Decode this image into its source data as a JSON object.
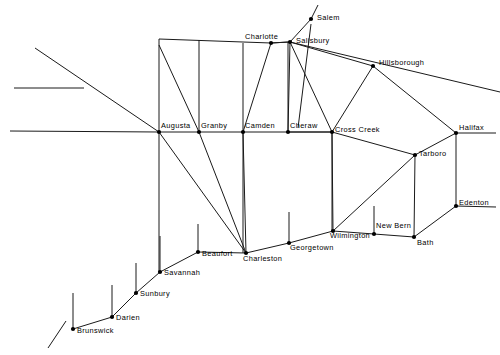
{
  "map": {
    "title": "Colonial Road Network Map",
    "background_color": "#ffffff",
    "line_color": "#1a1a1a",
    "node_color": "#000000",
    "width": 500,
    "height": 355,
    "cities": [
      {
        "name": "Salem",
        "x": 311,
        "y": 19,
        "label_x": 317,
        "label_y": 14,
        "dot": true
      },
      {
        "name": "Salisbury",
        "x": 290,
        "y": 42,
        "label_x": 296,
        "label_y": 37,
        "dot": true
      },
      {
        "name": "Charlotte",
        "x": 271,
        "y": 43,
        "label_x": 245,
        "label_y": 33,
        "dot": true
      },
      {
        "name": "Hillsborough",
        "x": 373,
        "y": 66,
        "label_x": 379,
        "label_y": 59,
        "dot": true
      },
      {
        "name": "Augusta",
        "x": 159,
        "y": 132,
        "label_x": 161,
        "label_y": 122,
        "dot": true
      },
      {
        "name": "Granby",
        "x": 199,
        "y": 132,
        "label_x": 201,
        "label_y": 122,
        "dot": true
      },
      {
        "name": "Camden",
        "x": 243,
        "y": 132,
        "label_x": 245,
        "label_y": 122,
        "dot": true
      },
      {
        "name": "Cheraw",
        "x": 288,
        "y": 132,
        "label_x": 290,
        "label_y": 122,
        "dot": true
      },
      {
        "name": "Cross Creek",
        "x": 332,
        "y": 132,
        "label_x": 335,
        "label_y": 126,
        "dot": true
      },
      {
        "name": "Halifax",
        "x": 456,
        "y": 133,
        "label_x": 459,
        "label_y": 124,
        "dot": true
      },
      {
        "name": "Tarboro",
        "x": 415,
        "y": 155,
        "label_x": 419,
        "label_y": 150,
        "dot": true
      },
      {
        "name": "Edenton",
        "x": 456,
        "y": 206,
        "label_x": 459,
        "label_y": 199,
        "dot": true
      },
      {
        "name": "Wilmington",
        "x": 333,
        "y": 231,
        "label_x": 330,
        "label_y": 232,
        "dot": true
      },
      {
        "name": "New Bern",
        "x": 374,
        "y": 234,
        "label_x": 376,
        "label_y": 222,
        "dot": true
      },
      {
        "name": "Bath",
        "x": 414,
        "y": 237,
        "label_x": 417,
        "label_y": 239,
        "dot": true
      },
      {
        "name": "Georgetown",
        "x": 289,
        "y": 243,
        "label_x": 290,
        "label_y": 244,
        "dot": true
      },
      {
        "name": "Charleston",
        "x": 246,
        "y": 253,
        "label_x": 243,
        "label_y": 255,
        "dot": true
      },
      {
        "name": "Beaufort",
        "x": 198,
        "y": 252,
        "label_x": 202,
        "label_y": 250,
        "dot": true
      },
      {
        "name": "Savannah",
        "x": 160,
        "y": 272,
        "label_x": 164,
        "label_y": 269,
        "dot": true
      },
      {
        "name": "Sunbury",
        "x": 136,
        "y": 293,
        "label_x": 140,
        "label_y": 290,
        "dot": true
      },
      {
        "name": "Darien",
        "x": 112,
        "y": 317,
        "label_x": 116,
        "label_y": 314,
        "dot": true
      },
      {
        "name": "Brunswick",
        "x": 73,
        "y": 329,
        "label_x": 77,
        "label_y": 327,
        "dot": true
      }
    ],
    "edges": [
      {
        "from": "Augusta",
        "to": "Granby"
      },
      {
        "from": "Granby",
        "to": "Camden"
      },
      {
        "from": "Camden",
        "to": "Cheraw"
      },
      {
        "from": "Cheraw",
        "to": "Cross Creek"
      },
      {
        "from": "Cross Creek",
        "to": "Tarboro"
      },
      {
        "from": "Tarboro",
        "to": "Halifax"
      },
      {
        "from": "Halifax",
        "to": "Edenton"
      },
      {
        "from": "Edenton",
        "to": "Bath"
      },
      {
        "from": "Tarboro",
        "to": "Bath"
      },
      {
        "from": "Bath",
        "to": "New Bern"
      },
      {
        "from": "New Bern",
        "to": "Wilmington"
      },
      {
        "from": "Wilmington",
        "to": "Tarboro"
      },
      {
        "from": "Wilmington",
        "to": "Cross Creek"
      },
      {
        "from": "Wilmington",
        "to": "Georgetown"
      },
      {
        "from": "Georgetown",
        "to": "Charleston"
      },
      {
        "from": "Charleston",
        "to": "Beaufort"
      },
      {
        "from": "Beaufort",
        "to": "Savannah"
      },
      {
        "from": "Savannah",
        "to": "Sunbury"
      },
      {
        "from": "Sunbury",
        "to": "Darien"
      },
      {
        "from": "Darien",
        "to": "Brunswick"
      },
      {
        "from": "Charleston",
        "to": "Camden"
      },
      {
        "from": "Charleston",
        "to": "Granby"
      },
      {
        "from": "Charleston",
        "to": "Augusta"
      },
      {
        "from": "Charlotte",
        "to": "Camden"
      },
      {
        "from": "Charlotte",
        "to": "Salisbury"
      },
      {
        "from": "Salisbury",
        "to": "Salem"
      },
      {
        "from": "Salisbury",
        "to": "Cheraw"
      },
      {
        "from": "Salisbury",
        "to": "Cross Creek"
      },
      {
        "from": "Salisbury",
        "to": "Hillsborough"
      },
      {
        "from": "Hillsborough",
        "to": "Cross Creek"
      },
      {
        "from": "Hillsborough",
        "to": "Halifax"
      },
      {
        "from": "Cross Creek",
        "to": "Cheraw"
      }
    ],
    "extra_segments": [
      {
        "name": "augusta-vertical",
        "x1": 159,
        "y1": 132,
        "x2": 159,
        "y2": 39
      },
      {
        "name": "augusta-to-charlotte",
        "x1": 159,
        "y1": 39,
        "x2": 271,
        "y2": 43
      },
      {
        "name": "augusta-diag-granby",
        "x1": 159,
        "y1": 45,
        "x2": 199,
        "y2": 132
      },
      {
        "name": "granby-vertical",
        "x1": 199,
        "y1": 132,
        "x2": 199,
        "y2": 40
      },
      {
        "name": "camden-vertical-up",
        "x1": 243,
        "y1": 132,
        "x2": 243,
        "y2": 43
      },
      {
        "name": "cheraw-vertical-up",
        "x1": 288,
        "y1": 132,
        "x2": 288,
        "y2": 42
      },
      {
        "name": "cheraw-charlotte-top",
        "x1": 271,
        "y1": 43,
        "x2": 288,
        "y2": 42
      },
      {
        "name": "crosscreek-vert-down",
        "x1": 332,
        "y1": 132,
        "x2": 332,
        "y2": 231
      },
      {
        "name": "camden-vert-down",
        "x1": 243,
        "y1": 132,
        "x2": 243,
        "y2": 253
      },
      {
        "name": "augusta-vert-down",
        "x1": 159,
        "y1": 132,
        "x2": 159,
        "y2": 272
      },
      {
        "name": "salisbury-longline-l",
        "x1": 290,
        "y1": 42,
        "x2": 500,
        "y2": 92
      },
      {
        "name": "left-diagonal-long",
        "x1": 35,
        "y1": 48,
        "x2": 159,
        "y2": 132
      },
      {
        "name": "left-horiz-upper",
        "x1": 14,
        "y1": 88,
        "x2": 84,
        "y2": 88
      },
      {
        "name": "left-horiz-main",
        "x1": 10,
        "y1": 131,
        "x2": 159,
        "y2": 132
      },
      {
        "name": "halifax-right-stub",
        "x1": 456,
        "y1": 133,
        "x2": 496,
        "y2": 133
      },
      {
        "name": "edenton-right-stub",
        "x1": 456,
        "y1": 206,
        "x2": 496,
        "y2": 207
      },
      {
        "name": "brunswick-downleft",
        "x1": 66,
        "y1": 321,
        "x2": 48,
        "y2": 348
      },
      {
        "name": "tick-beaufort",
        "x1": 198,
        "y1": 252,
        "x2": 198,
        "y2": 224
      },
      {
        "name": "tick-georgetown",
        "x1": 289,
        "y1": 243,
        "x2": 289,
        "y2": 212
      },
      {
        "name": "tick-newbern",
        "x1": 374,
        "y1": 234,
        "x2": 374,
        "y2": 206
      },
      {
        "name": "tick-savannah",
        "x1": 160,
        "y1": 272,
        "x2": 160,
        "y2": 236
      },
      {
        "name": "tick-sunbury",
        "x1": 136,
        "y1": 293,
        "x2": 136,
        "y2": 263
      },
      {
        "name": "tick-darien",
        "x1": 112,
        "y1": 317,
        "x2": 112,
        "y2": 285
      },
      {
        "name": "tick-brunswick",
        "x1": 73,
        "y1": 329,
        "x2": 73,
        "y2": 293
      },
      {
        "name": "salem-tick-up",
        "x1": 311,
        "y1": 19,
        "x2": 318,
        "y2": 5
      },
      {
        "name": "salem-down-cheraw",
        "x1": 311,
        "y1": 24,
        "x2": 298,
        "y2": 128
      }
    ]
  }
}
